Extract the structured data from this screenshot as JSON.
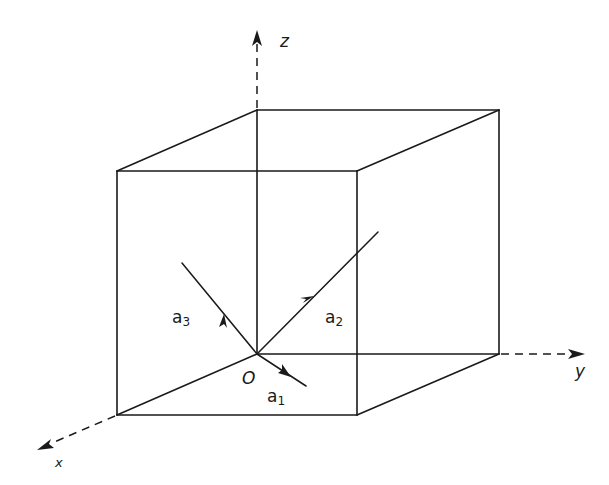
{
  "diagram": {
    "type": "3d-cube-with-vectors",
    "colors": {
      "background": "#ffffff",
      "ink": "#1a1a1a"
    },
    "axes": {
      "x": {
        "label": "x"
      },
      "y": {
        "label": "y"
      },
      "z": {
        "label": "z"
      }
    },
    "origin": {
      "label": "O"
    },
    "vectors": [
      {
        "name": "a1",
        "base": "a",
        "sub": "1"
      },
      {
        "name": "a2",
        "base": "a",
        "sub": "2"
      },
      {
        "name": "a3",
        "base": "a",
        "sub": "3"
      }
    ]
  }
}
